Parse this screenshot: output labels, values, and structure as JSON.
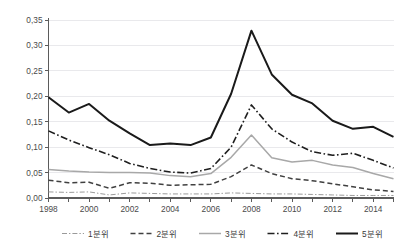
{
  "chart_data": {
    "type": "line",
    "title": "",
    "xlabel": "",
    "ylabel": "",
    "xlim": [
      1998,
      2015
    ],
    "ylim": [
      0.0,
      0.35
    ],
    "ytick_step": 0.05,
    "xtick_step": 2,
    "grid": true,
    "legend_position": "bottom",
    "decimal_separator": ",",
    "x": [
      1998,
      1999,
      2000,
      2001,
      2002,
      2003,
      2004,
      2005,
      2006,
      2007,
      2008,
      2009,
      2010,
      2011,
      2012,
      2013,
      2014,
      2015
    ],
    "ytick_labels": [
      "0,00",
      "0,05",
      "0,10",
      "0,15",
      "0,20",
      "0,25",
      "0,30",
      "0,35"
    ],
    "ytick_values": [
      0.0,
      0.05,
      0.1,
      0.15,
      0.2,
      0.25,
      0.3,
      0.35
    ],
    "xtick_labels": [
      "1998",
      "2000",
      "2002",
      "2004",
      "2006",
      "2008",
      "2010",
      "2012",
      "2014"
    ],
    "xtick_values": [
      1998,
      2000,
      2002,
      2004,
      2006,
      2008,
      2010,
      2012,
      2014
    ],
    "series": [
      {
        "name": "1분위",
        "values": [
          0.012,
          0.011,
          0.012,
          0.006,
          0.01,
          0.009,
          0.008,
          0.008,
          0.008,
          0.01,
          0.009,
          0.008,
          0.008,
          0.007,
          0.006,
          0.005,
          0.005,
          0.005
        ],
        "color": "#9a9a9a",
        "width": 1.0,
        "dash": "5,2,1.4,2"
      },
      {
        "name": "2분위",
        "values": [
          0.035,
          0.03,
          0.031,
          0.019,
          0.03,
          0.029,
          0.025,
          0.026,
          0.027,
          0.042,
          0.065,
          0.048,
          0.038,
          0.034,
          0.028,
          0.022,
          0.016,
          0.013
        ],
        "color": "#404040",
        "width": 1.5,
        "dash": "5,3"
      },
      {
        "name": "3분위",
        "values": [
          0.056,
          0.053,
          0.051,
          0.05,
          0.05,
          0.049,
          0.044,
          0.042,
          0.048,
          0.08,
          0.124,
          0.079,
          0.071,
          0.074,
          0.065,
          0.06,
          0.048,
          0.038
        ],
        "color": "#a8a8a8",
        "width": 1.5,
        "dash": "none"
      },
      {
        "name": "4분위",
        "values": [
          0.132,
          0.114,
          0.099,
          0.085,
          0.068,
          0.058,
          0.051,
          0.049,
          0.058,
          0.1,
          0.183,
          0.136,
          0.11,
          0.091,
          0.084,
          0.088,
          0.074,
          0.059
        ],
        "color": "#1f1f1f",
        "width": 1.6,
        "dash": "7,2.5,1.6,2.5"
      },
      {
        "name": "5분위",
        "values": [
          0.198,
          0.168,
          0.185,
          0.152,
          0.127,
          0.104,
          0.107,
          0.104,
          0.119,
          0.205,
          0.329,
          0.243,
          0.203,
          0.186,
          0.152,
          0.136,
          0.14,
          0.12
        ]
      }
    ],
    "series5_style": {
      "color": "#1a1a1a",
      "width": 2.0,
      "dash": "none"
    },
    "series5_extra": {
      "note": "",
      "tail_values": [
        0.096,
        0.077
      ]
    },
    "legend": [
      {
        "label": "1분위",
        "sample": "dash-dot-thin"
      },
      {
        "label": "2분위",
        "sample": "dashed"
      },
      {
        "label": "3분위",
        "sample": "solid-gray"
      },
      {
        "label": "4분위",
        "sample": "dash-dot-thick"
      },
      {
        "label": "5분위",
        "sample": "solid-black"
      }
    ]
  },
  "colors": {
    "grid": "#e9e9ec",
    "axis": "#5b5b5b",
    "text": "#3a3a3a",
    "background": "#ffffff"
  },
  "top_sliver_text": ""
}
